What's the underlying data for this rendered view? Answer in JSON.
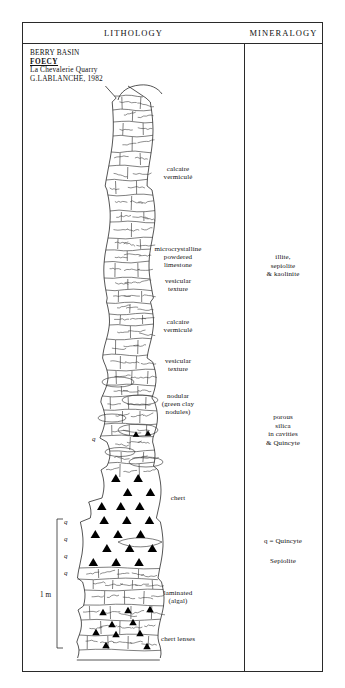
{
  "headers": {
    "lithology": "LITHOLOGY",
    "mineralogy": "MINERALOGY"
  },
  "title_block": {
    "line1": "BERRY  BASIN",
    "line2": "FOECY",
    "line3": "La Chevalerie Quarry",
    "line4": "G.LABLANCHE, 1982"
  },
  "lithology_labels": [
    {
      "id": "calcaire-vermicule-upper",
      "text": "calcaire\nvermiculé",
      "x": 178,
      "y": 165
    },
    {
      "id": "microcrystalline-powdered-limestone",
      "text": "microcrystalline\npowdered\nlimestone",
      "x": 178,
      "y": 245
    },
    {
      "id": "vesicular-texture-upper",
      "text": "vesicular\ntexture",
      "x": 178,
      "y": 277
    },
    {
      "id": "calcaire-vermicule-lower",
      "text": "calcaire\nvermiculé",
      "x": 178,
      "y": 318
    },
    {
      "id": "vesicular-texture-lower",
      "text": "vesicular\ntexture",
      "x": 178,
      "y": 357
    },
    {
      "id": "nodular-green-clay-nodules",
      "text": "nodular\n(green clay\nnodules)",
      "x": 178,
      "y": 392
    },
    {
      "id": "chert",
      "text": "chert",
      "x": 178,
      "y": 494
    },
    {
      "id": "laminated-algal",
      "text": "laminated\n(algal)",
      "x": 178,
      "y": 589
    },
    {
      "id": "chert-lenses",
      "text": "chert lenses",
      "x": 178,
      "y": 635
    }
  ],
  "mineralogy_labels": [
    {
      "id": "illite-sepiolite-kaolinite",
      "text": "illite,\nsepiolite\n& kaolinite",
      "y": 253
    },
    {
      "id": "porous-silica",
      "text": "porous\nsilica\nin cavities\n& Quincyte",
      "y": 413
    },
    {
      "id": "q-equals-quincyte",
      "text": "q = Quincyte",
      "y": 537
    },
    {
      "id": "sepiolite",
      "text": "Sepiolite",
      "y": 557
    }
  ],
  "quincyte_markers": [
    {
      "label": "q",
      "x": 92,
      "y": 435
    },
    {
      "label": "q",
      "x": 64,
      "y": 518
    },
    {
      "label": "q",
      "x": 64,
      "y": 535
    },
    {
      "label": "q",
      "x": 64,
      "y": 552
    },
    {
      "label": "q",
      "x": 64,
      "y": 569
    }
  ],
  "scale": {
    "label": "1 m",
    "x": 40,
    "y": 591
  },
  "colors": {
    "ink": "#1d1d1d",
    "paper": "#ffffff",
    "chert_fill": "#000000"
  }
}
